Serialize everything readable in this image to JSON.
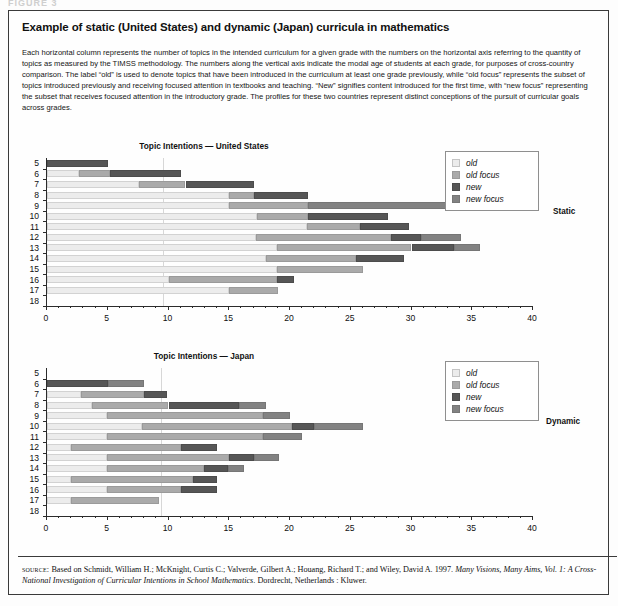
{
  "top_crop_text": "FIGURE 3",
  "title": "Example of static (United States) and dynamic (Japan) curricula in mathematics",
  "blurb": "Each horizontal column represents the number of topics in the intended curriculum for a given grade with the numbers on the horizontal axis referring to the quantity of topics as measured by the TIMSS methodology. The numbers along the vertical axis indicate the modal age of students at each grade, for purposes of cross-country comparison. The label “old” is used to denote topics that have been introduced in the curriculum at least one grade previously, while “old focus” represents the subset of topics introduced previously and receiving focused attention in textbooks and teaching. “New” signifies content introduced for the first time, with “new focus” representing the subset that receives focused attention in the introductory grade. The profiles for these two countries represent distinct conceptions of the pursuit of curricular goals across grades.",
  "legend": {
    "items": [
      {
        "key": "old",
        "label": "old"
      },
      {
        "key": "oldfocus",
        "label": "old focus"
      },
      {
        "key": "new",
        "label": "new"
      },
      {
        "key": "newfocus",
        "label": "new focus"
      }
    ]
  },
  "colors": {
    "old": "#ececec",
    "old_focus": "#aaaaaa",
    "new": "#565656",
    "new_focus": "#828282",
    "axis": "#2b2b2b",
    "grid": "#d7d7d7",
    "border": "#3a3a3a"
  },
  "side_labels": {
    "top": "Static",
    "bottom": "Dynamic"
  },
  "source": {
    "keyword": "source:",
    "line1": " Based on Schmidt, William H.; McKnight, Curtis C.; Valverde, Gilbert A.; Houang, Richard T.; and Wiley, David A. 1997. ",
    "italic1": "Many Visions, Many Aims, Vol. 1: A Cross-National Investigation of Curricular Intentions in School Mathematics",
    "line2": ". Dordrecht, Netherlands : Kluwer."
  },
  "chart_data": [
    {
      "type": "bar",
      "orientation": "horizontal",
      "stacked": true,
      "title": "Topic Intentions — United States",
      "region": "United States",
      "profile": "Static",
      "xlabel": "",
      "ylabel": "",
      "xlim": [
        0,
        40
      ],
      "ylim_categories": [
        "5",
        "6",
        "7",
        "8",
        "9",
        "10",
        "11",
        "12",
        "13",
        "14",
        "15",
        "16",
        "17",
        "18"
      ],
      "xticks": [
        0,
        5,
        10,
        15,
        20,
        25,
        30,
        35,
        40
      ],
      "xtick_labels": [
        "0",
        "5",
        "10",
        "15",
        "20",
        "25",
        "30",
        "35",
        "40"
      ],
      "xtick_minor_step": 1,
      "grid": "single vertical gridline at x=9.6",
      "gridline_x": 9.6,
      "legend_position": "top-right",
      "series": [
        {
          "name": "old",
          "values": [
            0.0,
            2.6,
            7.6,
            15.0,
            15.0,
            17.3,
            21.4,
            17.2,
            18.9,
            18.0,
            18.9,
            10.0,
            15.0,
            0.0
          ]
        },
        {
          "name": "old focus",
          "values": [
            0.0,
            2.6,
            3.8,
            2.0,
            6.5,
            4.2,
            4.4,
            11.1,
            11.1,
            7.4,
            7.1,
            8.9,
            4.0,
            0.0
          ]
        },
        {
          "name": "new",
          "values": [
            5.0,
            5.8,
            5.6,
            4.5,
            0.0,
            6.6,
            4.0,
            2.5,
            3.5,
            4.0,
            0.0,
            1.4,
            0.0,
            0.0
          ]
        },
        {
          "name": "new focus",
          "values": [
            0.0,
            0.0,
            0.0,
            0.0,
            11.5,
            0.0,
            0.0,
            3.3,
            2.1,
            0.0,
            0.0,
            0.0,
            0.0,
            0.0
          ]
        }
      ],
      "totals": [
        5.0,
        11.0,
        17.0,
        21.5,
        33.0,
        28.1,
        29.8,
        34.1,
        35.6,
        29.4,
        26.0,
        20.3,
        19.0,
        0.0
      ],
      "bar_segment_order": [
        "old",
        "old focus",
        "new",
        "new focus"
      ],
      "bars": [
        {
          "age": "5",
          "segments": [
            {
              "type": "new",
              "start": 0.0,
              "end": 5.0
            }
          ]
        },
        {
          "age": "6",
          "segments": [
            {
              "type": "old",
              "start": 0.0,
              "end": 2.6
            },
            {
              "type": "old focus",
              "start": 2.6,
              "end": 5.2
            },
            {
              "type": "new",
              "start": 5.2,
              "end": 11.0
            }
          ]
        },
        {
          "age": "7",
          "segments": [
            {
              "type": "old",
              "start": 0.0,
              "end": 7.6
            },
            {
              "type": "old focus",
              "start": 7.6,
              "end": 11.4
            },
            {
              "type": "new",
              "start": 11.4,
              "end": 17.0
            }
          ]
        },
        {
          "age": "8",
          "segments": [
            {
              "type": "old",
              "start": 0.0,
              "end": 15.0
            },
            {
              "type": "old focus",
              "start": 15.0,
              "end": 17.0
            },
            {
              "type": "new",
              "start": 17.0,
              "end": 21.5
            }
          ]
        },
        {
          "age": "9",
          "segments": [
            {
              "type": "old",
              "start": 0.0,
              "end": 15.0
            },
            {
              "type": "old focus",
              "start": 15.0,
              "end": 21.5
            },
            {
              "type": "new focus",
              "start": 21.5,
              "end": 33.0
            }
          ]
        },
        {
          "age": "10",
          "segments": [
            {
              "type": "old",
              "start": 0.0,
              "end": 17.3
            },
            {
              "type": "old focus",
              "start": 17.3,
              "end": 21.5
            },
            {
              "type": "new",
              "start": 21.5,
              "end": 28.1
            }
          ]
        },
        {
          "age": "11",
          "segments": [
            {
              "type": "old",
              "start": 0.0,
              "end": 21.4
            },
            {
              "type": "old focus",
              "start": 21.4,
              "end": 25.8
            },
            {
              "type": "new",
              "start": 25.8,
              "end": 29.8
            }
          ]
        },
        {
          "age": "12",
          "segments": [
            {
              "type": "old",
              "start": 0.0,
              "end": 17.2
            },
            {
              "type": "old focus",
              "start": 17.2,
              "end": 28.3
            },
            {
              "type": "new",
              "start": 28.3,
              "end": 30.8
            },
            {
              "type": "new focus",
              "start": 30.8,
              "end": 34.1
            }
          ]
        },
        {
          "age": "13",
          "segments": [
            {
              "type": "old",
              "start": 0.0,
              "end": 18.9
            },
            {
              "type": "old focus",
              "start": 18.9,
              "end": 30.0
            },
            {
              "type": "new",
              "start": 30.0,
              "end": 33.5
            },
            {
              "type": "new focus",
              "start": 33.5,
              "end": 35.6
            }
          ]
        },
        {
          "age": "14",
          "segments": [
            {
              "type": "old",
              "start": 0.0,
              "end": 18.0
            },
            {
              "type": "old focus",
              "start": 18.0,
              "end": 25.4
            },
            {
              "type": "new",
              "start": 25.4,
              "end": 29.4
            }
          ]
        },
        {
          "age": "15",
          "segments": [
            {
              "type": "old",
              "start": 0.0,
              "end": 18.9
            },
            {
              "type": "old focus",
              "start": 18.9,
              "end": 26.0
            }
          ]
        },
        {
          "age": "16",
          "segments": [
            {
              "type": "old",
              "start": 0.0,
              "end": 10.0
            },
            {
              "type": "old focus",
              "start": 10.0,
              "end": 18.9
            },
            {
              "type": "new",
              "start": 18.9,
              "end": 20.3
            }
          ]
        },
        {
          "age": "17",
          "segments": [
            {
              "type": "old",
              "start": 0.0,
              "end": 15.0
            },
            {
              "type": "old focus",
              "start": 15.0,
              "end": 19.0
            }
          ]
        },
        {
          "age": "18",
          "segments": []
        }
      ]
    },
    {
      "type": "bar",
      "orientation": "horizontal",
      "stacked": true,
      "title": "Topic Intentions — Japan",
      "region": "Japan",
      "profile": "Dynamic",
      "xlabel": "",
      "ylabel": "",
      "xlim": [
        0,
        40
      ],
      "ylim_categories": [
        "5",
        "6",
        "7",
        "8",
        "9",
        "10",
        "11",
        "12",
        "13",
        "14",
        "15",
        "16",
        "17",
        "18"
      ],
      "xticks": [
        0,
        5,
        10,
        15,
        20,
        25,
        30,
        35,
        40
      ],
      "xtick_labels": [
        "0",
        "5",
        "10",
        "15",
        "20",
        "25",
        "30",
        "35",
        "40"
      ],
      "xtick_minor_step": 1,
      "grid": "single vertical gridline at x=9.5",
      "gridline_x": 9.5,
      "legend_position": "top-right",
      "series": [
        {
          "name": "old",
          "values": [
            0.0,
            0.0,
            2.8,
            3.7,
            4.9,
            7.8,
            4.9,
            2.0,
            4.9,
            4.9,
            2.0,
            4.9,
            2.0,
            0.0
          ]
        },
        {
          "name": "old focus",
          "values": [
            0.0,
            0.0,
            5.2,
            6.3,
            12.9,
            12.4,
            12.9,
            9.0,
            10.1,
            8.0,
            10.0,
            6.1,
            7.2,
            0.0
          ]
        },
        {
          "name": "new",
          "values": [
            0.0,
            5.0,
            1.9,
            5.8,
            0.0,
            1.8,
            0.0,
            3.0,
            2.0,
            2.0,
            2.0,
            3.0,
            0.0,
            0.0
          ]
        },
        {
          "name": "new focus",
          "values": [
            0.0,
            3.0,
            0.0,
            2.2,
            2.2,
            4.0,
            3.2,
            0.0,
            2.1,
            1.3,
            0.0,
            0.0,
            0.0,
            0.0
          ]
        }
      ],
      "totals": [
        0.0,
        8.0,
        9.9,
        18.0,
        20.0,
        26.0,
        21.0,
        14.0,
        19.1,
        16.2,
        14.0,
        14.0,
        9.2,
        0.0
      ],
      "bar_segment_order": [
        "old",
        "old focus",
        "new",
        "new focus"
      ],
      "bars": [
        {
          "age": "5",
          "segments": []
        },
        {
          "age": "6",
          "segments": [
            {
              "type": "new",
              "start": 0.0,
              "end": 5.0
            },
            {
              "type": "new focus",
              "start": 5.0,
              "end": 8.0
            }
          ]
        },
        {
          "age": "7",
          "segments": [
            {
              "type": "old",
              "start": 0.0,
              "end": 2.8
            },
            {
              "type": "old focus",
              "start": 2.8,
              "end": 8.0
            },
            {
              "type": "new",
              "start": 8.0,
              "end": 9.9
            }
          ]
        },
        {
          "age": "8",
          "segments": [
            {
              "type": "old",
              "start": 0.0,
              "end": 3.7
            },
            {
              "type": "old focus",
              "start": 3.7,
              "end": 10.0
            },
            {
              "type": "new",
              "start": 10.0,
              "end": 15.8
            },
            {
              "type": "new focus",
              "start": 15.8,
              "end": 18.0
            }
          ]
        },
        {
          "age": "9",
          "segments": [
            {
              "type": "old",
              "start": 0.0,
              "end": 4.9
            },
            {
              "type": "old focus",
              "start": 4.9,
              "end": 17.8
            },
            {
              "type": "new focus",
              "start": 17.8,
              "end": 20.0
            }
          ]
        },
        {
          "age": "10",
          "segments": [
            {
              "type": "old",
              "start": 0.0,
              "end": 7.8
            },
            {
              "type": "old focus",
              "start": 7.8,
              "end": 20.2
            },
            {
              "type": "new",
              "start": 20.2,
              "end": 22.0
            },
            {
              "type": "new focus",
              "start": 22.0,
              "end": 26.0
            }
          ]
        },
        {
          "age": "11",
          "segments": [
            {
              "type": "old",
              "start": 0.0,
              "end": 4.9
            },
            {
              "type": "old focus",
              "start": 4.9,
              "end": 17.8
            },
            {
              "type": "new focus",
              "start": 17.8,
              "end": 21.0
            }
          ]
        },
        {
          "age": "12",
          "segments": [
            {
              "type": "old",
              "start": 0.0,
              "end": 2.0
            },
            {
              "type": "old focus",
              "start": 2.0,
              "end": 11.0
            },
            {
              "type": "new",
              "start": 11.0,
              "end": 14.0
            }
          ]
        },
        {
          "age": "13",
          "segments": [
            {
              "type": "old",
              "start": 0.0,
              "end": 4.9
            },
            {
              "type": "old focus",
              "start": 4.9,
              "end": 15.0
            },
            {
              "type": "new",
              "start": 15.0,
              "end": 17.0
            },
            {
              "type": "new focus",
              "start": 17.0,
              "end": 19.1
            }
          ]
        },
        {
          "age": "14",
          "segments": [
            {
              "type": "old",
              "start": 0.0,
              "end": 4.9
            },
            {
              "type": "old focus",
              "start": 4.9,
              "end": 12.9
            },
            {
              "type": "new",
              "start": 12.9,
              "end": 14.9
            },
            {
              "type": "new focus",
              "start": 14.9,
              "end": 16.2
            }
          ]
        },
        {
          "age": "15",
          "segments": [
            {
              "type": "old",
              "start": 0.0,
              "end": 2.0
            },
            {
              "type": "old focus",
              "start": 2.0,
              "end": 12.0
            },
            {
              "type": "new",
              "start": 12.0,
              "end": 14.0
            }
          ]
        },
        {
          "age": "16",
          "segments": [
            {
              "type": "old",
              "start": 0.0,
              "end": 4.9
            },
            {
              "type": "old focus",
              "start": 4.9,
              "end": 11.0
            },
            {
              "type": "new",
              "start": 11.0,
              "end": 14.0
            }
          ]
        },
        {
          "age": "17",
          "segments": [
            {
              "type": "old",
              "start": 0.0,
              "end": 2.0
            },
            {
              "type": "old focus",
              "start": 2.0,
              "end": 9.2
            }
          ]
        },
        {
          "age": "18",
          "segments": []
        }
      ]
    }
  ]
}
